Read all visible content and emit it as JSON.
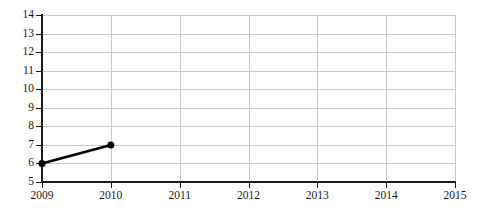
{
  "chart_data": {
    "type": "line",
    "title": "",
    "subtitle": "",
    "xlabel": "",
    "ylabel": "",
    "x": [
      2009,
      2010
    ],
    "values": [
      6,
      7
    ],
    "series": [
      {
        "name": "",
        "x": [
          2009,
          2010
        ],
        "values": [
          6,
          7
        ]
      }
    ],
    "x_tick_labels": [
      "2009",
      "2010",
      "2011",
      "2012",
      "2013",
      "2014",
      "2015"
    ],
    "y_tick_labels": [
      "14",
      "13",
      "12",
      "11",
      "10",
      "9",
      "8",
      "7",
      "6",
      "5"
    ],
    "xlim": [
      2009,
      2015
    ],
    "ylim": [
      5,
      14
    ],
    "grid": true,
    "legend": "none",
    "annotations": [],
    "colors": {
      "line": "#000000",
      "marker": "#000000",
      "grid": "#c9c9c9",
      "axis": "#1a1a1a",
      "background": "#ffffff"
    },
    "marker": "circle",
    "line_width": 2.6,
    "marker_size": 7
  }
}
